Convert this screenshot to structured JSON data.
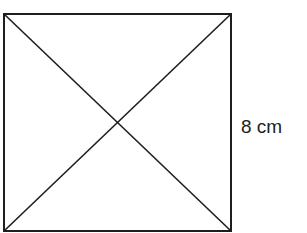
{
  "diagram": {
    "shape": "square",
    "side_label": "8 cm",
    "side_labeled": "right",
    "diagonals": 2,
    "stroke_color": "#1e1e1e",
    "square": {
      "x1": 4,
      "y1": 14,
      "x2": 231,
      "y2": 231
    }
  }
}
